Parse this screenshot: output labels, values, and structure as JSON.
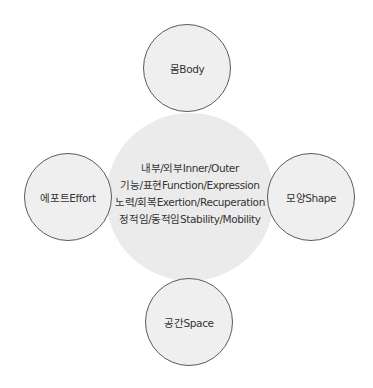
{
  "diagram": {
    "center": {
      "lines": [
        "내부/외부Inner/Outer",
        "기능/표현Function/Expression",
        "노력/회복Exertion/Recuperation",
        "정적임/동적임Stability/Mobility"
      ]
    },
    "nodes": {
      "top": {
        "label": "몸Body"
      },
      "left": {
        "label": "에포트Effort"
      },
      "right": {
        "label": "모양Shape"
      },
      "bottom": {
        "label": "공간Space"
      }
    },
    "colors": {
      "center_fill": "#ebebeb",
      "node_fill": "#efefef",
      "node_border": "#5a5a5a",
      "text": "#333333"
    }
  }
}
